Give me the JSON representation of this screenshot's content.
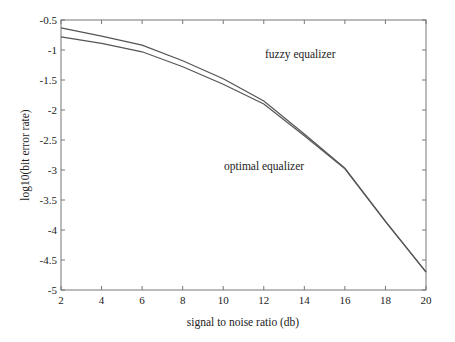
{
  "chart_data": {
    "type": "line",
    "title": "",
    "xlabel": "signal to noise ratio (db)",
    "ylabel": "log10(bit error rate)",
    "xlim": [
      2,
      20
    ],
    "ylim": [
      -5,
      -0.5
    ],
    "grid": false,
    "legend": null,
    "x_ticks": [
      2,
      4,
      6,
      8,
      10,
      12,
      14,
      16,
      18,
      20
    ],
    "x_tick_labels": [
      "2",
      "4",
      "6",
      "8",
      "10",
      "12",
      "14",
      "16",
      "18",
      "20"
    ],
    "y_ticks": [
      -0.5,
      -1,
      -1.5,
      -2,
      -2.5,
      -3,
      -3.5,
      -4,
      -4.5,
      -5
    ],
    "y_tick_labels": [
      "-0.5",
      "-1",
      "-1.5",
      "-2",
      "-2.5",
      "-3",
      "-3.5",
      "-4",
      "-4.5",
      "-5"
    ],
    "x": [
      2,
      4,
      6,
      8,
      10,
      12,
      14,
      16,
      18,
      20
    ],
    "series": [
      {
        "name": "fuzzy equalizer",
        "values": [
          -0.63,
          -0.77,
          -0.92,
          -1.18,
          -1.48,
          -1.85,
          -2.4,
          -2.97,
          -3.85,
          -4.7
        ]
      },
      {
        "name": "optimal equalizer",
        "values": [
          -0.78,
          -0.89,
          -1.03,
          -1.28,
          -1.57,
          -1.9,
          -2.43,
          -2.98,
          -3.86,
          -4.7
        ]
      }
    ],
    "annotations": [
      {
        "text": "fuzzy equalizer",
        "x": 13.5,
        "y": -0.88
      },
      {
        "text": "optimal equalizer",
        "x": 12.4,
        "y": -2.77
      }
    ],
    "line_color": "#555555"
  },
  "labels": {
    "xlabel": "signal to noise ratio (db)",
    "ylabel": "log10(bit error rate)",
    "annotation_fuzzy": "fuzzy equalizer",
    "annotation_optimal": "optimal equalizer"
  }
}
